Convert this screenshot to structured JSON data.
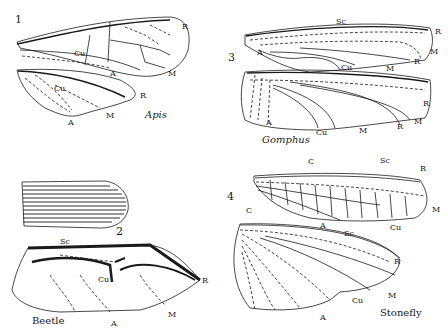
{
  "figures": [
    {
      "number": "1",
      "name": "Apis",
      "labels": {
        "fore_R": "R",
        "fore_Cu": "Cu",
        "fore_A": "A",
        "fore_M": "M",
        "hind_Cu": "Cu",
        "hind_R": "R",
        "hind_A": "A",
        "hind_M": "M"
      }
    },
    {
      "number": "2",
      "name": "Beetle",
      "labels": {
        "Sc": "Sc",
        "Cu": "Cu",
        "R": "R",
        "M": "M",
        "A": "A"
      }
    },
    {
      "number": "3",
      "name": "Gomphus",
      "labels": {
        "fore_Sc": "Sc",
        "fore_A": "A",
        "fore_Cu": "Cu",
        "fore_M": "M",
        "fore_R": "R",
        "fore_R2": "R",
        "fore_M2": "M",
        "hind_A": "A",
        "hind_Cu": "Cu",
        "hind_M": "M",
        "hind_R": "R",
        "hind_R2": "R",
        "hind_M2": "M"
      }
    },
    {
      "number": "4",
      "name": "Stonefly",
      "labels": {
        "fore_C": "C",
        "fore_Sc": "Sc",
        "fore_R": "R",
        "fore_M": "M",
        "fore_Cu": "Cu",
        "fore_A": "A",
        "hind_C": "C",
        "hind_Sc": "Sc",
        "hind_R": "R",
        "hind_M": "M",
        "hind_Cu": "Cu",
        "hind_A": "A"
      }
    }
  ],
  "colors": {
    "ink": "#1a1a1a",
    "background": "#ffffff"
  }
}
